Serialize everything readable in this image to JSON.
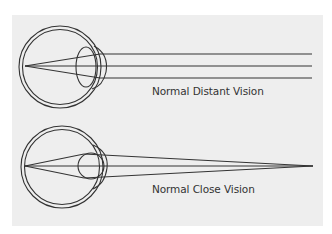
{
  "diagram": {
    "background_color": "#eeeeee",
    "line_color": "#333333",
    "panels": [
      {
        "id": "distant",
        "label": "Normal Distant Vision",
        "description": "Parallel light rays enter the eye and focus on the retina"
      },
      {
        "id": "close",
        "label": "Normal Close Vision",
        "description": "Diverging light rays from a near point source focus on the retina through a rounder lens"
      }
    ]
  }
}
